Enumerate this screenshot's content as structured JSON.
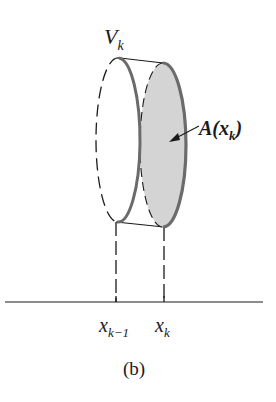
{
  "figure": {
    "caption": "(b)",
    "volume_label": {
      "main": "V",
      "sub": "k"
    },
    "area_label": {
      "main": "A(x",
      "sub": "k",
      "close": ")"
    },
    "axis_labels": [
      {
        "main": "x",
        "sub": "k−1"
      },
      {
        "main": "x",
        "sub": "k"
      }
    ],
    "colors": {
      "line": "#1a1a1a",
      "rim": "#6b6b6b",
      "shaded_face": "#d4d4d4",
      "background": "#ffffff"
    },
    "elements": [
      "slab-left-face-dashed-ellipse",
      "slab-right-face-shaded-ellipse",
      "arrow-to-area",
      "dashed-projection-lines",
      "x-axis"
    ]
  }
}
